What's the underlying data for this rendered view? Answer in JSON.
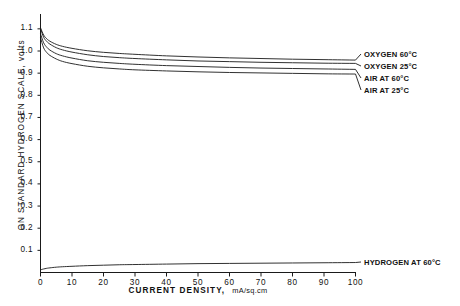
{
  "chart_data": {
    "type": "line",
    "title": "",
    "xlabel": "CURRENT DENSITY,",
    "xunits": "mA/sq.cm",
    "ylabel": "ON STANDARD HYDROGEN SCALE, volts",
    "xlim": [
      0,
      100
    ],
    "ylim": [
      0,
      1.15
    ],
    "grid": false,
    "legend_position": "right-inline-labels",
    "x_ticks": [
      0,
      10,
      20,
      30,
      40,
      50,
      60,
      70,
      80,
      90,
      100
    ],
    "x_tick_labels": [
      "0",
      "10",
      "20",
      "30",
      "40",
      "50",
      "60",
      "70",
      "80",
      "90",
      "100"
    ],
    "y_ticks": [
      0.1,
      0.2,
      0.3,
      0.4,
      0.5,
      0.6,
      0.7,
      0.8,
      0.9,
      1.0,
      1.1
    ],
    "y_tick_labels": [
      "0.1",
      "0.2",
      "0.3",
      "0.4",
      "0.5",
      "0.6",
      "0.7",
      "0.8",
      "0.9",
      "1.0",
      "1.1"
    ],
    "x": [
      0,
      1,
      2,
      3,
      5,
      7,
      10,
      15,
      20,
      25,
      30,
      40,
      50,
      60,
      70,
      80,
      90,
      100
    ],
    "series": [
      {
        "name": "OXYGEN 60°C",
        "label": "OXYGEN 60°C",
        "color": "#1a1a1a",
        "values": [
          1.105,
          1.072,
          1.055,
          1.044,
          1.03,
          1.021,
          1.012,
          1.001,
          0.994,
          0.989,
          0.985,
          0.978,
          0.973,
          0.969,
          0.966,
          0.963,
          0.961,
          0.959
        ]
      },
      {
        "name": "OXYGEN 25°C",
        "label": "OXYGEN 25°C",
        "color": "#1a1a1a",
        "values": [
          1.1,
          1.062,
          1.043,
          1.031,
          1.015,
          1.005,
          0.995,
          0.983,
          0.975,
          0.97,
          0.966,
          0.96,
          0.955,
          0.952,
          0.949,
          0.947,
          0.945,
          0.944
        ]
      },
      {
        "name": "AIR AT 60°C",
        "label": "AIR AT 60°C",
        "color": "#1a1a1a",
        "values": [
          1.078,
          1.037,
          1.017,
          1.004,
          0.988,
          0.978,
          0.968,
          0.956,
          0.949,
          0.944,
          0.94,
          0.934,
          0.93,
          0.926,
          0.923,
          0.921,
          0.919,
          0.917
        ]
      },
      {
        "name": "AIR AT 25°C",
        "label": "AIR AT 25°C",
        "color": "#1a1a1a",
        "values": [
          1.06,
          1.014,
          0.993,
          0.98,
          0.964,
          0.953,
          0.943,
          0.931,
          0.924,
          0.919,
          0.915,
          0.91,
          0.906,
          0.903,
          0.901,
          0.899,
          0.897,
          0.896
        ]
      },
      {
        "name": "HYDROGEN AT 60°C",
        "label": "HYDROGEN AT 60°C",
        "color": "#1a1a1a",
        "values": [
          0.012,
          0.016,
          0.019,
          0.021,
          0.024,
          0.026,
          0.028,
          0.031,
          0.033,
          0.035,
          0.036,
          0.038,
          0.04,
          0.041,
          0.042,
          0.043,
          0.044,
          0.045
        ]
      }
    ]
  },
  "axis": {
    "y_title": "ON STANDARD HYDROGEN SCALE, volts",
    "x_title": "CURRENT DENSITY,",
    "x_units": "mA/sq.cm"
  },
  "labels": {
    "oxygen_60": "OXYGEN 60°C",
    "oxygen_25": "OXYGEN 25°C",
    "air_60": "AIR AT 60°C",
    "air_25": "AIR AT 25°C",
    "hydrogen_60": "HYDROGEN AT 60°C"
  },
  "y_tick_labels": [
    "1.1",
    "1.0",
    "0.9",
    "0.8",
    "0.7",
    "0.6",
    "0.5",
    "0.4",
    "0.3",
    "0.2",
    "0.1"
  ],
  "x_tick_labels": [
    "0",
    "10",
    "20",
    "30",
    "40",
    "50",
    "60",
    "70",
    "80",
    "90",
    "100"
  ]
}
